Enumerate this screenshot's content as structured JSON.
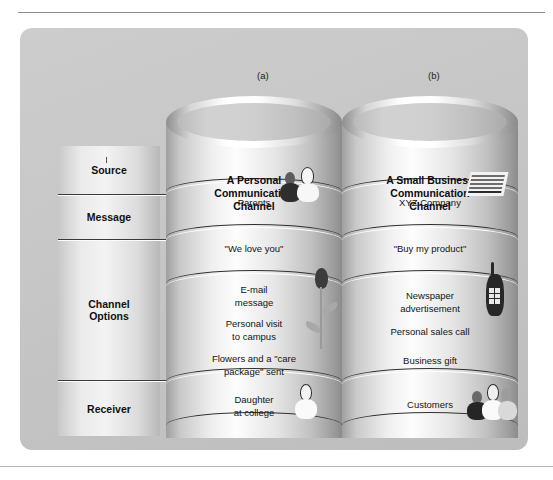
{
  "page": {
    "header_text": "",
    "panel_bg": "#c6c6c6"
  },
  "figure": {
    "columns": [
      {
        "caption": "(a)",
        "title": "A Personal\nCommunication\nChannel",
        "title_line1": "A Personal",
        "title_line2": "Communication",
        "title_line3": "Channel",
        "bands": {
          "source": "Parents",
          "message": "\"We love you\"",
          "channel_options": [
            "E-mail\nmessage",
            "Personal visit\nto campus",
            "Flowers and a \"care\npackage\" sent"
          ],
          "channel_option_1_line1": "E-mail",
          "channel_option_1_line2": "message",
          "channel_option_2_line1": "Personal visit",
          "channel_option_2_line2": "to campus",
          "channel_option_3_line1": "Flowers and a \"care",
          "channel_option_3_line2": "package\" sent",
          "receiver_line1": "Daughter",
          "receiver_line2": "at college"
        },
        "icons": {
          "source": "two-people-icon",
          "channel": "rose-flower-icon",
          "receiver": "single-person-icon"
        }
      },
      {
        "caption": "(b)",
        "title": "A Small Business\nCommunication\nChannel",
        "title_line1": "A Small Business",
        "title_line2": "Communication",
        "title_line3": "Channel",
        "bands": {
          "source": "XYZ Company",
          "message": "\"Buy my product\"",
          "channel_options": [
            "Newspaper\nadvertisement",
            "Personal sales call",
            "Business gift"
          ],
          "channel_option_1_line1": "Newspaper",
          "channel_option_1_line2": "advertisement",
          "channel_option_2_line1": "Personal sales call",
          "channel_option_3_line1": "Business gift",
          "receiver_line1": "Customers"
        },
        "icons": {
          "source": "document-letterhead-icon",
          "channel": "mobile-phone-icon",
          "receiver": "group-of-people-icon"
        }
      }
    ],
    "row_labels": [
      {
        "label": "Source"
      },
      {
        "label": "Message"
      },
      {
        "label": "Channel\nOptions",
        "line1": "Channel",
        "line2": "Options"
      },
      {
        "label": "Receiver"
      }
    ]
  }
}
